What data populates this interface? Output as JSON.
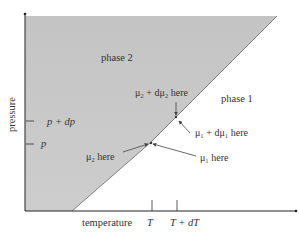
{
  "diagram": {
    "type": "phase-diagram",
    "axes": {
      "x_label": "temperature",
      "y_label": "pressure",
      "x_ticks": [
        {
          "label": "T"
        },
        {
          "label": "T + dT"
        }
      ],
      "y_ticks": [
        {
          "label": "p + dp"
        },
        {
          "label": "p"
        }
      ]
    },
    "regions": [
      {
        "label": "phase 2",
        "fill": "#c8c8c8"
      },
      {
        "label": "phase 1",
        "fill": "#ffffff"
      }
    ],
    "annotations": {
      "mu2_plus": "μ₂ + dμ₂ here",
      "mu1_plus": "μ₁ + dμ₁ here",
      "mu2": "μ₂ here",
      "mu1": "μ₁ here"
    },
    "colors": {
      "axis": "#222222",
      "shaded": "#c9c9c9",
      "boundary": "#555555",
      "text": "#333333",
      "arrow": "#444444"
    }
  }
}
